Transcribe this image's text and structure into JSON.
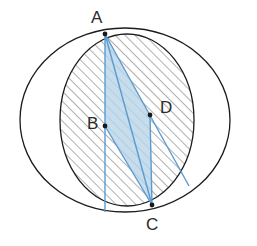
{
  "figure": {
    "kind": "geometry-diagram",
    "canvas": {
      "width": 257,
      "height": 246,
      "background": "#ffffff"
    },
    "colors": {
      "outline": "#1c1c1c",
      "hatch": "#6e6e6e",
      "blue_line": "#5b9bd1",
      "blue_fill": "#b6d3e8",
      "label_text": "#2b2b2b",
      "point_dot": "#1a1a1a"
    },
    "labels": [
      {
        "id": "A",
        "text": "A"
      },
      {
        "id": "B",
        "text": "B"
      },
      {
        "id": "C",
        "text": "C"
      },
      {
        "id": "D",
        "text": "D"
      }
    ],
    "points": [
      {
        "id": "A",
        "x": 105,
        "y": 34
      },
      {
        "id": "B",
        "x": 105,
        "y": 126
      },
      {
        "id": "C",
        "x": 152,
        "y": 205
      },
      {
        "id": "D",
        "x": 150,
        "y": 115
      }
    ],
    "circles": [
      {
        "id": "outer-circle",
        "cx": 125,
        "cy": 120,
        "rx": 105,
        "ry": 92,
        "fill": "none",
        "stroke": "#1c1c1c",
        "hatched": false
      },
      {
        "id": "inner-circle",
        "cx": 127,
        "cy": 120,
        "rx": 67,
        "ry": 86,
        "fill": "hatch",
        "stroke": "#1c1c1c",
        "hatched": true
      }
    ],
    "segments": [
      {
        "id": "vertical-line-through-A-B",
        "from": "A",
        "to": "bottom",
        "x1": 105,
        "y1": 32,
        "x2": 105,
        "y2": 212,
        "color": "#5b9bd1"
      },
      {
        "id": "chord-A-to-C",
        "from": "A",
        "to": "C",
        "x1": 105,
        "y1": 34,
        "x2": 152,
        "y2": 205,
        "color": "#5b9bd1"
      },
      {
        "id": "ray-A-through-D",
        "from": "A",
        "to": "D-extended",
        "x1": 105,
        "y1": 34,
        "x2": 189,
        "y2": 186,
        "color": "#5b9bd1"
      },
      {
        "id": "chord-B-to-C",
        "from": "B",
        "to": "C",
        "x1": 105,
        "y1": 126,
        "x2": 152,
        "y2": 205,
        "color": "#5b9bd1"
      },
      {
        "id": "chord-D-to-C",
        "from": "D",
        "to": "C",
        "x1": 150,
        "y1": 115,
        "x2": 152,
        "y2": 205,
        "color": "#5b9bd1"
      }
    ],
    "shaded_region": {
      "id": "quadrilateral-A-B-C-D",
      "vertices": [
        "A",
        "B",
        "C",
        "D"
      ],
      "fill": "#b6d3e8",
      "opacity": 0.75
    }
  }
}
